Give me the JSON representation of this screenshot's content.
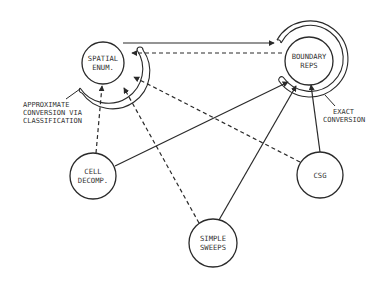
{
  "diagram": {
    "nodes": {
      "spatial_enum": {
        "line1": "SPATIAL",
        "line2": "ENUM."
      },
      "boundary_reps": {
        "line1": "BOUNDARY",
        "line2": "REPS"
      },
      "cell_decomp": {
        "line1": "CELL",
        "line2": "DECOMP."
      },
      "csg": {
        "line1": "CSG"
      },
      "simple_sweeps": {
        "line1": "SIMPLE",
        "line2": "SWEEPS"
      }
    },
    "annotations": {
      "approximate": {
        "line1": "APPROXIMATE",
        "line2": "CONVERSION VIA",
        "line3": "CLASSIFICATION"
      },
      "exact": {
        "line1": "EXACT",
        "line2": "CONVERSION"
      }
    },
    "edges": [
      {
        "from": "spatial_enum",
        "to": "boundary_reps",
        "style": "solid"
      },
      {
        "from": "boundary_reps",
        "to": "spatial_enum",
        "style": "dashed"
      },
      {
        "from": "cell_decomp",
        "to": "boundary_reps",
        "style": "solid"
      },
      {
        "from": "csg",
        "to": "spatial_enum",
        "style": "dashed"
      },
      {
        "from": "csg",
        "to": "boundary_reps",
        "style": "solid"
      },
      {
        "from": "simple_sweeps",
        "to": "boundary_reps",
        "style": "solid"
      },
      {
        "from": "simple_sweeps",
        "to": "spatial_enum",
        "style": "dashed"
      },
      {
        "from": "cell_decomp",
        "to": "spatial_enum",
        "style": "dashed"
      }
    ],
    "colors": {
      "ink": "#2a2a2a",
      "background": "#ffffff"
    }
  }
}
